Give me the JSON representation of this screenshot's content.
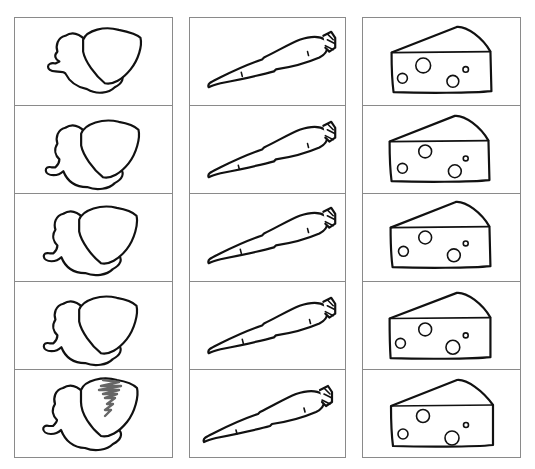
{
  "worksheet": {
    "columns": [
      {
        "name": "acorn",
        "icon": "acorn-icon",
        "rows": [
          {
            "label": "acorn",
            "shaded": false
          },
          {
            "label": "acorn",
            "shaded": false
          },
          {
            "label": "acorn",
            "shaded": false
          },
          {
            "label": "acorn",
            "shaded": false
          },
          {
            "label": "acorn",
            "shaded": true
          }
        ]
      },
      {
        "name": "carrot",
        "icon": "carrot-icon",
        "rows": [
          {
            "label": "carrot"
          },
          {
            "label": "carrot"
          },
          {
            "label": "carrot"
          },
          {
            "label": "carrot"
          },
          {
            "label": "carrot"
          }
        ]
      },
      {
        "name": "cheese",
        "icon": "cheese-icon",
        "rows": [
          {
            "label": "cheese"
          },
          {
            "label": "cheese"
          },
          {
            "label": "cheese"
          },
          {
            "label": "cheese"
          },
          {
            "label": "cheese"
          }
        ]
      }
    ],
    "colors": {
      "border": "#8a8a8a",
      "outline": "#111111",
      "shading": "#666666"
    }
  }
}
